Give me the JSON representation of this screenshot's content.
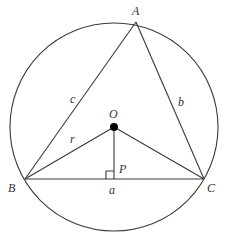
{
  "diagram": {
    "type": "circumscribed-triangle",
    "colors": {
      "stroke": "#3a3a3a",
      "label": "#333333",
      "center_dot": "#000000",
      "background": "#ffffff"
    },
    "circle": {
      "center": [
        114,
        127
      ],
      "radius": 104
    },
    "points": {
      "A": [
        136,
        22
      ],
      "B": [
        25,
        179
      ],
      "C": [
        204,
        179
      ],
      "O": [
        114,
        127
      ],
      "P": [
        114,
        179
      ]
    },
    "right_angle_marker": {
      "at": "P",
      "size": 8
    },
    "labels": {
      "A": "A",
      "B": "B",
      "C": "C",
      "O": "O",
      "P": "P",
      "side_a": "a",
      "side_b": "b",
      "side_c": "c",
      "radius": "r"
    }
  }
}
